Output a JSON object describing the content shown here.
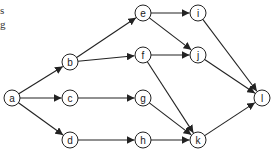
{
  "text_fragments": [
    "s",
    "g"
  ],
  "graph": {
    "nodes": [
      {
        "id": "a",
        "x": 12,
        "y": 98
      },
      {
        "id": "b",
        "x": 70,
        "y": 62
      },
      {
        "id": "c",
        "x": 70,
        "y": 98
      },
      {
        "id": "d",
        "x": 70,
        "y": 140
      },
      {
        "id": "e",
        "x": 143,
        "y": 13
      },
      {
        "id": "f",
        "x": 143,
        "y": 55
      },
      {
        "id": "g",
        "x": 143,
        "y": 98
      },
      {
        "id": "h",
        "x": 143,
        "y": 140
      },
      {
        "id": "i",
        "x": 198,
        "y": 13
      },
      {
        "id": "j",
        "x": 198,
        "y": 55
      },
      {
        "id": "k",
        "x": 198,
        "y": 140
      },
      {
        "id": "l",
        "x": 262,
        "y": 98
      }
    ],
    "edges": [
      [
        "a",
        "b"
      ],
      [
        "a",
        "c"
      ],
      [
        "a",
        "d"
      ],
      [
        "b",
        "e"
      ],
      [
        "b",
        "f"
      ],
      [
        "c",
        "g"
      ],
      [
        "d",
        "h"
      ],
      [
        "e",
        "i"
      ],
      [
        "e",
        "j"
      ],
      [
        "f",
        "j"
      ],
      [
        "f",
        "k"
      ],
      [
        "g",
        "k"
      ],
      [
        "h",
        "k"
      ],
      [
        "i",
        "l"
      ],
      [
        "j",
        "l"
      ],
      [
        "k",
        "l"
      ]
    ],
    "node_radius": 8,
    "stroke_color": "#222222",
    "fill_color": "#ffffff"
  }
}
